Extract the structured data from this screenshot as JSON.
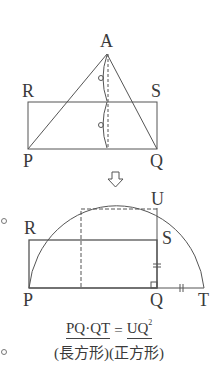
{
  "figure1": {
    "labels": {
      "A": "A",
      "R": "R",
      "S": "S",
      "P": "P",
      "Q": "Q"
    },
    "description": "Triangle APQ with altitude from A; rectangle PQSR of half height"
  },
  "arrow": {
    "icon": "down-arrow-icon"
  },
  "figure2": {
    "labels": {
      "U": "U",
      "R": "R",
      "S": "S",
      "P": "P",
      "Q": "Q",
      "T": "T"
    },
    "description": "Semicircle on diameter PT; QU perpendicular; dashed square on UQ; QS = QT marks"
  },
  "formula": {
    "left": "PQ·QT",
    "equals": "=",
    "right": "UQ",
    "right_sup": "2",
    "left_caption": "(長方形)",
    "right_caption": "(正方形)"
  },
  "markers": [
    "○",
    "○"
  ],
  "colors": {
    "line": "#555555",
    "text": "#3a3a3a"
  }
}
